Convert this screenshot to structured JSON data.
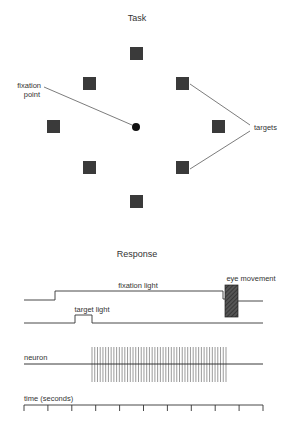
{
  "task": {
    "title": "Task",
    "fixation_label_line1": "fixation",
    "fixation_label_line2": "point",
    "targets_label": "targets",
    "square_color": "#3a3a3a",
    "targets": [
      {
        "name": "top",
        "x": 130,
        "y": 47
      },
      {
        "name": "upper-left",
        "x": 83,
        "y": 77
      },
      {
        "name": "upper-right",
        "x": 176,
        "y": 77
      },
      {
        "name": "left",
        "x": 47,
        "y": 120
      },
      {
        "name": "right",
        "x": 212,
        "y": 120
      },
      {
        "name": "lower-left",
        "x": 83,
        "y": 161
      },
      {
        "name": "lower-right",
        "x": 176,
        "y": 161
      },
      {
        "name": "bottom",
        "x": 130,
        "y": 195
      }
    ]
  },
  "response": {
    "title": "Response",
    "fixation_light_label": "fixation light",
    "target_light_label": "target light",
    "eye_movement_label": "eye movement",
    "neuron_label": "neuron",
    "time_label": "time (seconds)",
    "spike_count": 50,
    "spike_start_x": 92,
    "spike_end_x": 226,
    "time_ticks": 11
  }
}
